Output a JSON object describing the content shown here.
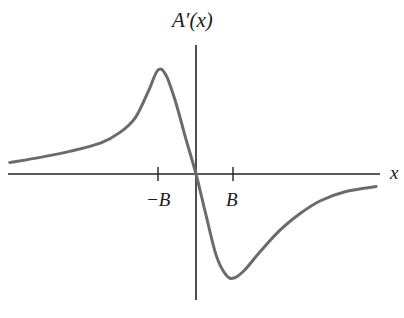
{
  "chart_data": {
    "type": "line",
    "title": "",
    "ylabel": "A′(x)",
    "xlabel": "x",
    "x_ticks": [
      "−B",
      "B"
    ],
    "grid": false,
    "legend": null,
    "series": [
      {
        "name": "A′(x)",
        "color": "#6b6b6b",
        "x": [
          -4.9,
          -4.1,
          -3.3,
          -2.5,
          -2.0,
          -1.6,
          -1.26,
          -1.0,
          -0.79,
          -0.55,
          -0.26,
          0,
          0.26,
          0.53,
          0.79,
          1.0,
          1.29,
          1.68,
          2.21,
          2.74,
          3.26,
          3.92,
          4.74
        ],
        "y": [
          0.11,
          0.16,
          0.22,
          0.3,
          0.4,
          0.54,
          0.79,
          1.0,
          0.95,
          0.71,
          0.33,
          0,
          -0.39,
          -0.78,
          -0.97,
          -1.0,
          -0.92,
          -0.75,
          -0.54,
          -0.38,
          -0.26,
          -0.17,
          -0.12
        ]
      }
    ],
    "axes_px": {
      "origin_x": 196,
      "origin_y": 174,
      "x_left": 8,
      "x_right": 380,
      "y_top": 45,
      "y_bottom": 300,
      "unit_x": 38,
      "unit_y": 104
    }
  },
  "labels": {
    "y_axis": "A′(x)",
    "x_axis": "x",
    "tick_neg": "−B",
    "tick_pos": "B"
  }
}
